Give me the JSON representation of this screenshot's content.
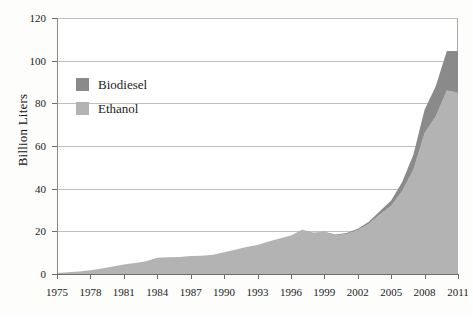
{
  "chart_data": {
    "type": "area",
    "stacked": true,
    "title": "",
    "subtitle": "",
    "xlabel": "",
    "ylabel": "Billion Liters",
    "ylim": [
      0,
      120
    ],
    "yticks": [
      0,
      20,
      40,
      60,
      80,
      100,
      120
    ],
    "xlim": [
      1975,
      2011
    ],
    "xticks": [
      1975,
      1978,
      1981,
      1984,
      1987,
      1990,
      1993,
      1996,
      1999,
      2002,
      2005,
      2008,
      2011
    ],
    "grid": "horizontal",
    "legend_position": "upper-left-inside",
    "x": [
      1975,
      1976,
      1977,
      1978,
      1979,
      1980,
      1981,
      1982,
      1983,
      1984,
      1985,
      1986,
      1987,
      1988,
      1989,
      1990,
      1991,
      1992,
      1993,
      1994,
      1995,
      1996,
      1997,
      1998,
      1999,
      2000,
      2001,
      2002,
      2003,
      2004,
      2005,
      2006,
      2007,
      2008,
      2009,
      2010,
      2011
    ],
    "series": [
      {
        "name": "Ethanol",
        "color": "#b3b3b3",
        "values": [
          0.5,
          0.8,
          1.2,
          1.8,
          2.6,
          3.5,
          4.4,
          5.2,
          6.0,
          7.6,
          7.8,
          8.0,
          8.4,
          8.6,
          9.0,
          10.2,
          11.4,
          12.6,
          13.6,
          15.2,
          16.6,
          18.0,
          20.6,
          19.4,
          19.6,
          18.2,
          18.8,
          20.6,
          23.6,
          28.0,
          32.0,
          39.0,
          49.0,
          66.0,
          74.0,
          86.0,
          85.0
        ]
      },
      {
        "name": "Biodiesel",
        "color": "#8a8a8a",
        "values": [
          0,
          0,
          0,
          0,
          0,
          0,
          0,
          0,
          0,
          0,
          0,
          0,
          0,
          0,
          0,
          0,
          0,
          0,
          0,
          0,
          0,
          0,
          0.1,
          0.1,
          0.2,
          0.3,
          0.4,
          0.6,
          0.9,
          1.5,
          2.4,
          4.2,
          7.0,
          11.0,
          14.0,
          18.5,
          19.5
        ]
      }
    ]
  },
  "legend": {
    "items": [
      {
        "label": "Biodiesel",
        "color": "#8a8a8a"
      },
      {
        "label": "Ethanol",
        "color": "#b3b3b3"
      }
    ]
  },
  "axes": {
    "y_title": "Billion Liters",
    "y_labels": [
      "120",
      "100",
      "80",
      "60",
      "40",
      "20",
      "0"
    ],
    "x_labels": [
      "1975",
      "1978",
      "1981",
      "1984",
      "1987",
      "1990",
      "1993",
      "1996",
      "1999",
      "2002",
      "2005",
      "2008",
      "2011"
    ]
  }
}
